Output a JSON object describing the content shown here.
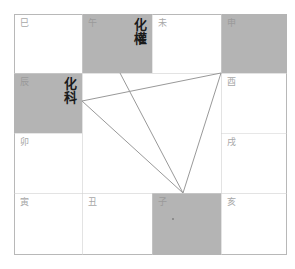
{
  "chart": {
    "layout": "4x4 perimeter grid (twelve earthly branches)",
    "colors": {
      "shaded": "#b4b4b4",
      "border": "#b8b8b8",
      "label": "#a8a8a8",
      "transform_text": "#1a1a1a",
      "line": "#999999"
    },
    "cells": [
      {
        "id": "si",
        "label": "巳",
        "row": 0,
        "col": 0,
        "shaded": false,
        "transform": ""
      },
      {
        "id": "wu",
        "label": "午",
        "row": 0,
        "col": 1,
        "shaded": true,
        "transform": "化權"
      },
      {
        "id": "wei",
        "label": "未",
        "row": 0,
        "col": 2,
        "shaded": false,
        "transform": ""
      },
      {
        "id": "shen",
        "label": "申",
        "row": 0,
        "col": 3,
        "shaded": true,
        "transform": ""
      },
      {
        "id": "chen",
        "label": "辰",
        "row": 1,
        "col": 0,
        "shaded": true,
        "transform": "化科"
      },
      {
        "id": "you",
        "label": "酉",
        "row": 1,
        "col": 3,
        "shaded": false,
        "transform": ""
      },
      {
        "id": "mao",
        "label": "卯",
        "row": 2,
        "col": 0,
        "shaded": false,
        "transform": ""
      },
      {
        "id": "xu",
        "label": "戌",
        "row": 2,
        "col": 3,
        "shaded": false,
        "transform": ""
      },
      {
        "id": "yin",
        "label": "寅",
        "row": 3,
        "col": 0,
        "shaded": false,
        "transform": ""
      },
      {
        "id": "chou",
        "label": "丑",
        "row": 3,
        "col": 1,
        "shaded": false,
        "transform": ""
      },
      {
        "id": "zi",
        "label": "子",
        "row": 3,
        "col": 2,
        "shaded": true,
        "transform": ""
      },
      {
        "id": "hai",
        "label": "亥",
        "row": 3,
        "col": 3,
        "shaded": false,
        "transform": ""
      }
    ],
    "connections": [
      {
        "from": "zi",
        "to": "wu"
      },
      {
        "from": "zi",
        "to": "chen"
      },
      {
        "from": "zi",
        "to": "shen"
      },
      {
        "from": "chen",
        "to": "shen"
      }
    ]
  }
}
